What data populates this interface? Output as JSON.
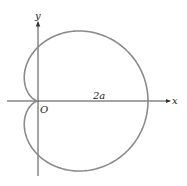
{
  "diagram": {
    "curve": {
      "equation": "r = a(1 + cos θ)",
      "a_px": 55,
      "stroke": "#8a8a8a"
    },
    "labels": {
      "x_axis": "x",
      "y_axis": "y",
      "origin": "O",
      "width": "2a"
    },
    "axis_color": "#333333"
  }
}
